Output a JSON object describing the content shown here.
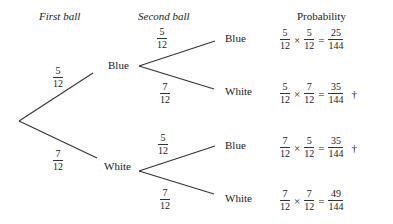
{
  "headers": {
    "first": "First ball",
    "second": "Second ball",
    "probability": "Probability"
  },
  "first_level": [
    {
      "label": "Blue",
      "prob": {
        "num": "5",
        "den": "12"
      }
    },
    {
      "label": "White",
      "prob": {
        "num": "7",
        "den": "12"
      }
    }
  ],
  "second_level": [
    {
      "label": "Blue",
      "prob": {
        "num": "5",
        "den": "12"
      }
    },
    {
      "label": "White",
      "prob": {
        "num": "7",
        "den": "12"
      }
    },
    {
      "label": "Blue",
      "prob": {
        "num": "5",
        "den": "12"
      }
    },
    {
      "label": "White",
      "prob": {
        "num": "7",
        "den": "12"
      }
    }
  ],
  "outcomes": [
    {
      "a": {
        "num": "5",
        "den": "12"
      },
      "b": {
        "num": "5",
        "den": "12"
      },
      "r": {
        "num": "25",
        "den": "144"
      },
      "mark": ""
    },
    {
      "a": {
        "num": "5",
        "den": "12"
      },
      "b": {
        "num": "7",
        "den": "12"
      },
      "r": {
        "num": "35",
        "den": "144"
      },
      "mark": "†"
    },
    {
      "a": {
        "num": "7",
        "den": "12"
      },
      "b": {
        "num": "5",
        "den": "12"
      },
      "r": {
        "num": "35",
        "den": "144"
      },
      "mark": "†"
    },
    {
      "a": {
        "num": "7",
        "den": "12"
      },
      "b": {
        "num": "7",
        "den": "12"
      },
      "r": {
        "num": "49",
        "den": "144"
      },
      "mark": ""
    }
  ],
  "symbols": {
    "times": "×",
    "equals": "="
  },
  "colors": {
    "line": "#333333",
    "text": "#222222"
  }
}
